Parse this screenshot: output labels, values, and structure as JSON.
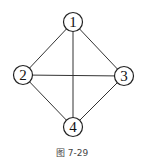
{
  "figure": {
    "caption": "图 7-29",
    "nodes": [
      {
        "id": "1",
        "label": "1",
        "x": 73,
        "y": 22
      },
      {
        "id": "2",
        "label": "2",
        "x": 23,
        "y": 75
      },
      {
        "id": "3",
        "label": "3",
        "x": 124,
        "y": 76
      },
      {
        "id": "4",
        "label": "4",
        "x": 73,
        "y": 127
      }
    ],
    "edges": [
      [
        "1",
        "2"
      ],
      [
        "1",
        "3"
      ],
      [
        "1",
        "4"
      ],
      [
        "2",
        "3"
      ],
      [
        "2",
        "4"
      ],
      [
        "3",
        "4"
      ]
    ],
    "node_radius": 9.5
  }
}
